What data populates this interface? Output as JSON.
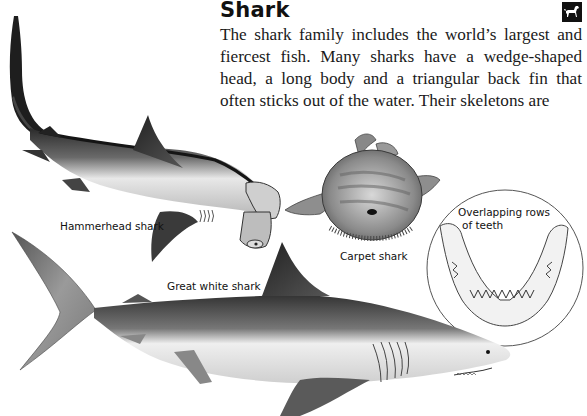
{
  "page": {
    "heading": "Shark",
    "body_text": "The shark family includes the world’s largest and fiercest fish. Many sharks have a wedge-shaped head, a long body and a triangular back fin that often sticks out of the water. Their skeletons are",
    "section_icon": "dog-icon"
  },
  "illustrations": {
    "hammerhead": {
      "label": "Hammerhead shark"
    },
    "carpet": {
      "label": "Carpet shark"
    },
    "great_white": {
      "label": "Great white shark"
    },
    "jaw_inset": {
      "label_line1": "Overlapping rows",
      "label_line2": "of teeth"
    }
  },
  "colors": {
    "text": "#1a1a1a",
    "icon_bg": "#111111",
    "background": "#ffffff"
  }
}
